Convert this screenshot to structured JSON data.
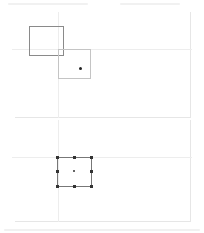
{
  "canvas": {
    "width": 204,
    "height": 233,
    "background": "#ffffff"
  },
  "colors": {
    "frame": "#e6e6e6",
    "guide": "#ededed",
    "rect_dark": "#8a8a8a",
    "rect_light": "#c4c4c4",
    "rect_selected": "#777777",
    "handle": "#333333"
  },
  "panels": [
    {
      "name": "before",
      "frame": {
        "left": 15,
        "top": 12,
        "right": 190,
        "bottom": 117
      },
      "guides": {
        "h_y": 49,
        "v_x": 58
      },
      "shapes": [
        {
          "kind": "rect",
          "state": "original",
          "x": 29,
          "y": 26,
          "w": 34,
          "h": 29,
          "stroke": "#8a8a8a"
        },
        {
          "kind": "rect",
          "state": "moved",
          "x": 58,
          "y": 49,
          "w": 32,
          "h": 29,
          "stroke": "#c4c4c4"
        }
      ],
      "marker": {
        "x": 80,
        "y": 68
      }
    },
    {
      "name": "after",
      "frame": {
        "left": 15,
        "top": 120,
        "right": 190,
        "bottom": 221
      },
      "guides": {
        "h_y": 157,
        "v_x": 58
      },
      "selected_rect": {
        "x": 57,
        "y": 157,
        "w": 34,
        "h": 29,
        "stroke": "#777777"
      },
      "handles": [
        {
          "pos": "top-left",
          "x": 57,
          "y": 157
        },
        {
          "pos": "top-center",
          "x": 74,
          "y": 157
        },
        {
          "pos": "top-right",
          "x": 91,
          "y": 157
        },
        {
          "pos": "middle-left",
          "x": 57,
          "y": 171
        },
        {
          "pos": "middle-right",
          "x": 91,
          "y": 171
        },
        {
          "pos": "bottom-left",
          "x": 57,
          "y": 186
        },
        {
          "pos": "bottom-center",
          "x": 74,
          "y": 186
        },
        {
          "pos": "bottom-right",
          "x": 91,
          "y": 186
        }
      ],
      "center": {
        "x": 74,
        "y": 171
      }
    }
  ]
}
